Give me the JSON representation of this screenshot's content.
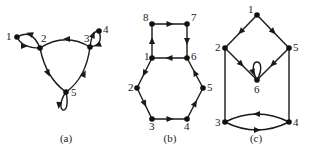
{
  "figure": {
    "background": "#ffffff",
    "ink_color": "#1a1a1a",
    "graphs": [
      {
        "id": "a",
        "caption": "(a)",
        "caption_pos": [
          66,
          142
        ],
        "nodes": [
          {
            "id": "1",
            "x": 17,
            "y": 37,
            "label": "1",
            "lx": 6,
            "ly": 40
          },
          {
            "id": "2",
            "x": 40,
            "y": 48,
            "label": "2",
            "lx": 41,
            "ly": 42
          },
          {
            "id": "3",
            "x": 90,
            "y": 47,
            "label": "3",
            "lx": 84,
            "ly": 42
          },
          {
            "id": "4",
            "x": 99,
            "y": 31,
            "label": "4",
            "lx": 103,
            "ly": 33
          },
          {
            "id": "5",
            "x": 66,
            "y": 92,
            "label": "5",
            "lx": 71,
            "ly": 96
          }
        ],
        "edges": [
          {
            "from": "3",
            "to": "2",
            "type": "arc",
            "d": "M90,47 Q65,32 40,48",
            "arrow_at": [
              67,
              39
            ],
            "arrow_dir": 180
          },
          {
            "from": "2",
            "to": "5",
            "type": "arc",
            "d": "M40,48 Q46,78 66,92",
            "arrow_at": [
              48,
              73
            ],
            "arrow_dir": 65
          },
          {
            "from": "5",
            "to": "3",
            "type": "arc",
            "d": "M66,92 Q86,78 90,47",
            "arrow_at": [
              84,
              74
            ],
            "arrow_dir": -65
          },
          {
            "from": "2",
            "to": "1",
            "type": "arc",
            "d": "M40,48 Q32,28 17,37",
            "arrow_at": [
              30,
              34
            ],
            "arrow_dir": 200
          },
          {
            "from": "1",
            "to": "2",
            "type": "arc",
            "d": "M17,37 Q22,48 40,48",
            "arrow_at": [
              24,
              46
            ],
            "arrow_dir": 0
          },
          {
            "from": "3",
            "to": "4",
            "type": "arc",
            "d": "M90,47 Q92,30 99,31",
            "arrow_at": [
              93,
              35
            ],
            "arrow_dir": -70
          },
          {
            "from": "4",
            "to": "3",
            "type": "arc",
            "d": "M99,31 Q104,45 90,47",
            "arrow_at": [
              98,
              45
            ],
            "arrow_dir": 160
          },
          {
            "from": "5",
            "to": "5",
            "type": "loop",
            "d": "M66,92 C52,112 72,120 66,92",
            "arrow_at": [
              59,
              105
            ],
            "arrow_dir": 95
          }
        ]
      },
      {
        "id": "b",
        "caption": "(b)",
        "caption_pos": [
          170,
          142
        ],
        "nodes": [
          {
            "id": "1",
            "x": 152,
            "y": 58,
            "label": "1",
            "lx": 144,
            "ly": 60
          },
          {
            "id": "2",
            "x": 137,
            "y": 88,
            "label": "2",
            "lx": 128,
            "ly": 91
          },
          {
            "id": "3",
            "x": 152,
            "y": 119,
            "label": "3",
            "lx": 149,
            "ly": 130
          },
          {
            "id": "4",
            "x": 187,
            "y": 119,
            "label": "4",
            "lx": 184,
            "ly": 130
          },
          {
            "id": "5",
            "x": 203,
            "y": 88,
            "label": "5",
            "lx": 207,
            "ly": 91
          },
          {
            "id": "6",
            "x": 187,
            "y": 58,
            "label": "6",
            "lx": 191,
            "ly": 60
          },
          {
            "id": "7",
            "x": 187,
            "y": 24,
            "label": "7",
            "lx": 191,
            "ly": 21
          },
          {
            "id": "8",
            "x": 152,
            "y": 24,
            "label": "8",
            "lx": 143,
            "ly": 21
          }
        ],
        "edges": [
          {
            "from": "8",
            "to": "7",
            "type": "line",
            "arrow_dir": 0
          },
          {
            "from": "7",
            "to": "6",
            "type": "line",
            "arrow_dir": 90
          },
          {
            "from": "6",
            "to": "1",
            "type": "line",
            "arrow_dir": 180
          },
          {
            "from": "1",
            "to": "8",
            "type": "line",
            "arrow_dir": -90
          },
          {
            "from": "1",
            "to": "2",
            "type": "line",
            "arrow_dir": 117
          },
          {
            "from": "2",
            "to": "3",
            "type": "line",
            "arrow_dir": 64
          },
          {
            "from": "3",
            "to": "4",
            "type": "line",
            "arrow_dir": 0
          },
          {
            "from": "4",
            "to": "5",
            "type": "line",
            "arrow_dir": -63
          },
          {
            "from": "5",
            "to": "6",
            "type": "line",
            "arrow_dir": -118
          }
        ]
      },
      {
        "id": "c",
        "caption": "(c)",
        "caption_pos": [
          256,
          142
        ],
        "nodes": [
          {
            "id": "1",
            "x": 257,
            "y": 15,
            "label": "1",
            "lx": 248,
            "ly": 13
          },
          {
            "id": "2",
            "x": 225,
            "y": 48,
            "label": "2",
            "lx": 215,
            "ly": 51
          },
          {
            "id": "3",
            "x": 225,
            "y": 122,
            "label": "3",
            "lx": 215,
            "ly": 126
          },
          {
            "id": "4",
            "x": 289,
            "y": 122,
            "label": "4",
            "lx": 293,
            "ly": 126
          },
          {
            "id": "5",
            "x": 289,
            "y": 48,
            "label": "5",
            "lx": 293,
            "ly": 51
          },
          {
            "id": "6",
            "x": 257,
            "y": 80,
            "label": "6",
            "lx": 254,
            "ly": 93
          }
        ],
        "edges": [
          {
            "from": "1",
            "to": "2",
            "type": "line",
            "arrow_dir": 134
          },
          {
            "from": "1",
            "to": "5",
            "type": "line",
            "arrow_dir": 46
          },
          {
            "from": "2",
            "to": "6",
            "type": "line",
            "arrow_dir": 46
          },
          {
            "from": "5",
            "to": "6",
            "type": "line",
            "arrow_dir": 134
          },
          {
            "from": "2",
            "to": "3",
            "type": "line",
            "arrow_dir": null
          },
          {
            "from": "5",
            "to": "4",
            "type": "line",
            "arrow_dir": null
          },
          {
            "from": "4",
            "to": "3",
            "type": "arc",
            "d": "M289,122 Q257,106 225,122",
            "arrow_at": [
              257,
              114
            ],
            "arrow_dir": 180
          },
          {
            "from": "3",
            "to": "4",
            "type": "arc",
            "d": "M225,122 Q257,138 289,122",
            "arrow_at": [
              257,
              130
            ],
            "arrow_dir": 0
          },
          {
            "from": "6",
            "to": "6",
            "type": "loop",
            "d": "M257,80 C244,56 270,56 257,80",
            "arrow_at": [
              253,
              72
            ],
            "arrow_dir": 70
          }
        ]
      }
    ]
  }
}
